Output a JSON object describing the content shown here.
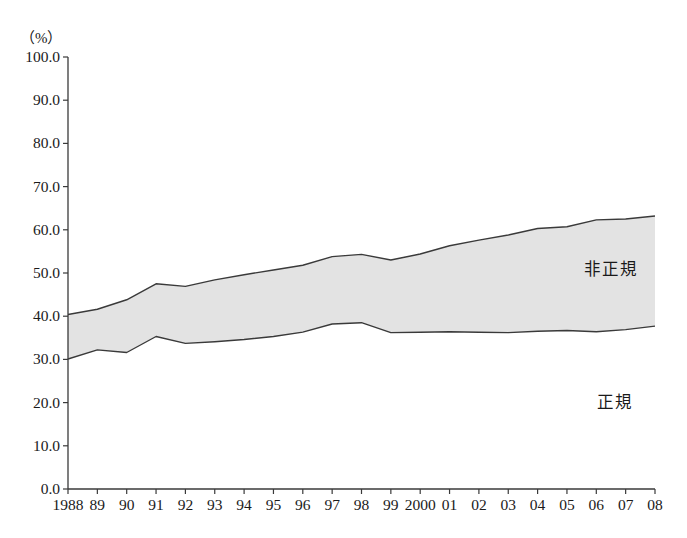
{
  "chart_data": {
    "type": "area",
    "stacked": false,
    "title": "",
    "subtitle": "",
    "xlabel": "",
    "ylabel": "",
    "unit_label": "（%）",
    "ylim": [
      0.0,
      100.0
    ],
    "ytick_labels": [
      "0.0",
      "10.0",
      "20.0",
      "30.0",
      "40.0",
      "50.0",
      "60.0",
      "70.0",
      "80.0",
      "90.0",
      "100.0"
    ],
    "ytick_values": [
      0.0,
      10.0,
      20.0,
      30.0,
      40.0,
      50.0,
      60.0,
      70.0,
      80.0,
      90.0,
      100.0
    ],
    "grid": false,
    "legend_position": "inside-right",
    "x": [
      1988,
      1989,
      1990,
      1991,
      1992,
      1993,
      1994,
      1995,
      1996,
      1997,
      1998,
      1999,
      2000,
      2001,
      2002,
      2003,
      2004,
      2005,
      2006,
      2007,
      2008
    ],
    "xtick_labels": [
      "1988",
      "89",
      "90",
      "91",
      "92",
      "93",
      "94",
      "95",
      "96",
      "97",
      "98",
      "99",
      "2000",
      "01",
      "02",
      "03",
      "04",
      "05",
      "06",
      "07",
      "08"
    ],
    "series": [
      {
        "name": "非正規",
        "role": "upper-boundary",
        "values": [
          40.4,
          41.6,
          43.8,
          47.5,
          46.9,
          48.4,
          49.6,
          50.7,
          51.8,
          53.8,
          54.3,
          53.0,
          54.4,
          56.3,
          57.6,
          58.8,
          60.3,
          60.7,
          62.3,
          62.5,
          63.2
        ]
      },
      {
        "name": "正規",
        "role": "lower-boundary",
        "values": [
          30.1,
          32.2,
          31.6,
          35.3,
          33.7,
          34.1,
          34.6,
          35.3,
          36.3,
          38.2,
          38.5,
          36.2,
          36.3,
          36.4,
          36.3,
          36.2,
          36.5,
          36.7,
          36.4,
          36.9,
          37.7
        ]
      }
    ],
    "band_label_upper": "非正規",
    "band_label_lower": "正規",
    "colors": {
      "band_fill": "#e3e3e3",
      "line": "#3a3a3a",
      "axis": "#3a3a3a",
      "text": "#1a1a1a",
      "background": "#ffffff"
    }
  }
}
